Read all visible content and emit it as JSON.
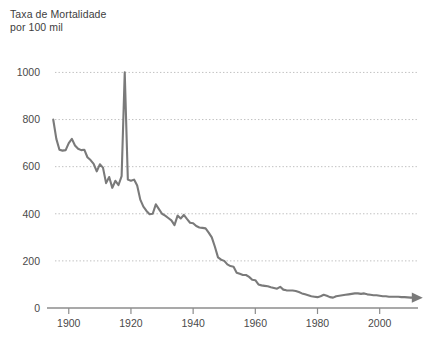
{
  "chart_data": {
    "type": "line",
    "title_line1": "Taxa de Mortalidade",
    "title_line2": "por 100 mil",
    "xlabel": "",
    "ylabel": "",
    "xlim": [
      1893,
      2012
    ],
    "ylim": [
      0,
      1040
    ],
    "grid": true,
    "grid_axis": "y",
    "legend": "none",
    "line_color": "#7a7a7a",
    "grid_color": "#b9b9b9",
    "axis_color": "#8c8c8c",
    "text_color": "#4a4a4a",
    "background_color": "#ffffff",
    "end_arrow": true,
    "yticks": [
      0,
      200,
      400,
      600,
      800,
      1000
    ],
    "ytick_labels": [
      "0",
      "200",
      "400",
      "600",
      "800",
      "1000"
    ],
    "xticks": [
      1900,
      1920,
      1940,
      1960,
      1980,
      2000
    ],
    "xtick_labels": [
      "1900",
      "1920",
      "1940",
      "1960",
      "1980",
      "2000"
    ],
    "x": [
      1895,
      1896,
      1897,
      1898,
      1899,
      1900,
      1901,
      1902,
      1903,
      1904,
      1905,
      1906,
      1907,
      1908,
      1909,
      1910,
      1911,
      1912,
      1913,
      1914,
      1915,
      1916,
      1917,
      1918,
      1919,
      1920,
      1921,
      1922,
      1923,
      1924,
      1925,
      1926,
      1927,
      1928,
      1929,
      1930,
      1931,
      1932,
      1933,
      1934,
      1935,
      1936,
      1937,
      1938,
      1939,
      1940,
      1941,
      1942,
      1943,
      1944,
      1945,
      1946,
      1947,
      1948,
      1949,
      1950,
      1951,
      1952,
      1953,
      1954,
      1955,
      1956,
      1957,
      1958,
      1959,
      1960,
      1961,
      1962,
      1963,
      1964,
      1965,
      1966,
      1967,
      1968,
      1969,
      1970,
      1971,
      1972,
      1973,
      1974,
      1975,
      1976,
      1977,
      1978,
      1979,
      1980,
      1981,
      1982,
      1983,
      1984,
      1985,
      1986,
      1987,
      1988,
      1989,
      1990,
      1991,
      1992,
      1993,
      1994,
      1995,
      1996,
      1997,
      1998,
      1999,
      2000,
      2001,
      2002,
      2003,
      2004,
      2005,
      2006,
      2007,
      2008,
      2009,
      2010
    ],
    "values": [
      800,
      718,
      672,
      668,
      670,
      700,
      718,
      690,
      676,
      670,
      672,
      640,
      628,
      612,
      580,
      610,
      596,
      530,
      556,
      510,
      540,
      522,
      560,
      1000,
      545,
      540,
      545,
      520,
      460,
      430,
      412,
      398,
      400,
      440,
      420,
      400,
      392,
      382,
      372,
      352,
      392,
      380,
      395,
      378,
      362,
      360,
      348,
      342,
      340,
      338,
      320,
      300,
      260,
      215,
      205,
      200,
      185,
      178,
      175,
      150,
      145,
      140,
      140,
      132,
      120,
      118,
      100,
      96,
      94,
      92,
      88,
      85,
      82,
      90,
      78,
      75,
      74,
      74,
      72,
      68,
      62,
      58,
      54,
      50,
      48,
      46,
      50,
      56,
      52,
      46,
      44,
      50,
      52,
      54,
      56,
      58,
      60,
      62,
      62,
      60,
      62,
      58,
      56,
      54,
      54,
      52,
      50,
      50,
      48,
      48,
      48,
      48,
      46,
      46,
      45,
      44
    ]
  }
}
